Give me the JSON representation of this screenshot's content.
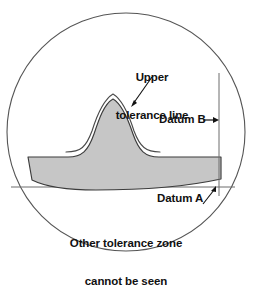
{
  "figure": {
    "annotations": {
      "upper_tolerance_line": "Upper\ntolerance line",
      "upper_tolerance_line_1": "Upper",
      "upper_tolerance_line_2": "tolerance line",
      "datum_b": "Datum B",
      "datum_a": "Datum A",
      "other_zone": "Other tolerance zone\ncannot be seen",
      "other_zone_1": "Other tolerance zone",
      "other_zone_2": "cannot be seen"
    },
    "colors": {
      "profile_fill": "#c6c6c6",
      "profile_stroke": "#3b3b3b",
      "circle_stroke": "#555555",
      "tolerance_line": "#4a4a4a",
      "datum_line": "#6d6d6d",
      "leader_line": "#111111",
      "text": "#111111",
      "background": "#ffffff"
    },
    "geometry": {
      "circle_center_x": 126,
      "circle_center_y": 132,
      "circle_radius": 119,
      "datum_a_y": 187,
      "datum_b_x": 219,
      "datum_b_top_y": 73,
      "datum_b_bottom_y": 196,
      "profile_peak_x": 113,
      "profile_peak_y": 97,
      "profile_base_y": 157
    }
  }
}
